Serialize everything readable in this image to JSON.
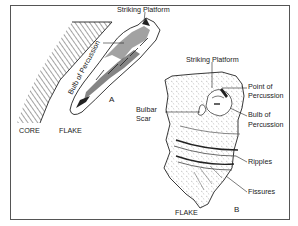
{
  "figure": {
    "border_color": "#444444",
    "ink_color": "#1a1a1a",
    "panel_a": {
      "label": "A",
      "core_label": "CORE",
      "flake_label": "FLAKE",
      "striking_platform_label": "Striking Platform",
      "bulb_label": "Bulb of Percussion"
    },
    "panel_b": {
      "label": "B",
      "flake_label": "FLAKE",
      "striking_platform_label": "Striking Platform",
      "point_of_percussion_label_1": "Point of",
      "point_of_percussion_label_2": "Percussion",
      "bulbar_scar_label_1": "Bulbar",
      "bulbar_scar_label_2": "Scar",
      "bulb_label_1": "Bulb of",
      "bulb_label_2": "Percussion",
      "ripples_label": "Ripples",
      "fissures_label": "Fissures"
    }
  }
}
